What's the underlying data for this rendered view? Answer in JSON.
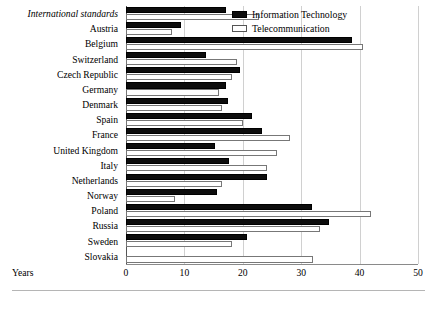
{
  "chart_data": {
    "type": "bar",
    "orientation": "horizontal",
    "title": "",
    "xlabel": "Years",
    "ylabel": "",
    "xlim": [
      0,
      50
    ],
    "xticks": [
      0,
      10,
      20,
      30,
      40,
      50
    ],
    "grid": true,
    "legend_position": "top-right",
    "categories": [
      "International standards",
      "Austria",
      "Belgium",
      "Switzerland",
      "Czech Republic",
      "Germany",
      "Denmark",
      "Spain",
      "France",
      "United Kingdom",
      "Italy",
      "Netherlands",
      "Norway",
      "Poland",
      "Russia",
      "Sweden",
      "Slovakia"
    ],
    "emphasized_categories": [
      "International standards"
    ],
    "series": [
      {
        "name": "Information Technology",
        "color": "#0d0d0d",
        "values": [
          17.1,
          9.4,
          38.7,
          13.7,
          19.5,
          17.1,
          17.4,
          21.5,
          23.3,
          15.2,
          17.6,
          24.1,
          15.6,
          31.8,
          34.7,
          20.8,
          null
        ]
      },
      {
        "name": "Telecommunication",
        "color": "#ffffff",
        "values": [
          22.8,
          7.9,
          40.6,
          19.0,
          18.2,
          16.0,
          16.4,
          20.0,
          28.0,
          25.9,
          24.1,
          16.4,
          8.4,
          41.9,
          33.2,
          18.2,
          32.0
        ]
      }
    ]
  },
  "legend": {
    "items": [
      {
        "label": "Information Technology",
        "swatch": "filled-black"
      },
      {
        "label": "Telecommunication",
        "swatch": "outlined-white"
      }
    ]
  },
  "axis": {
    "x_label": "Years",
    "tick_labels": [
      "0",
      "10",
      "20",
      "30",
      "40",
      "50"
    ]
  }
}
